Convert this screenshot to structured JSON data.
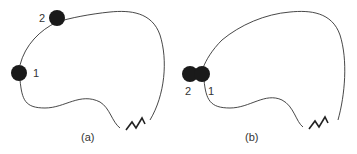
{
  "figure": {
    "panels": [
      {
        "id": "a",
        "caption": "(a)",
        "particles": [
          {
            "label": "1",
            "cx": 19,
            "cy": 73,
            "r": 8
          },
          {
            "label": "2",
            "cx": 57,
            "cy": 18,
            "r": 8
          }
        ]
      },
      {
        "id": "b",
        "caption": "(b)",
        "particles": [
          {
            "label": "2",
            "cx": 190,
            "cy": 74,
            "r": 8
          },
          {
            "label": "1",
            "cx": 202,
            "cy": 74,
            "r": 8
          }
        ]
      }
    ],
    "colors": {
      "line": "#333333",
      "particle": "#1a1a1a",
      "background": "#ffffff"
    }
  }
}
